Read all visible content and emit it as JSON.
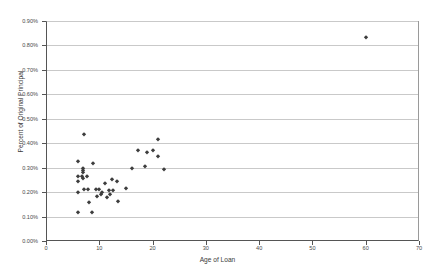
{
  "chart_data": {
    "type": "scatter",
    "title": "",
    "xlabel": "Age of Loan",
    "ylabel": "Percent of Original Principal",
    "xlim": [
      0,
      70
    ],
    "ylim": [
      0.0,
      0.9
    ],
    "xticks": [
      0,
      10,
      20,
      30,
      40,
      50,
      60,
      70
    ],
    "xtick_labels": [
      "0",
      "10",
      "20",
      "30",
      "40",
      "50",
      "60",
      "70"
    ],
    "yticks": [
      0.0,
      0.1,
      0.2,
      0.3,
      0.4,
      0.5,
      0.6,
      0.7,
      0.8,
      0.9
    ],
    "ytick_labels": [
      "0.00%",
      "0.10%",
      "0.20%",
      "0.30%",
      "0.40%",
      "0.50%",
      "0.60%",
      "0.70%",
      "0.80%",
      "0.90%"
    ],
    "grid": "horizontal",
    "legend": "none",
    "marker": "diamond",
    "marker_color": "#3d3d3d",
    "series": [
      {
        "name": "Loans",
        "points": [
          [
            5.8,
            0.205
          ],
          [
            5.8,
            0.248
          ],
          [
            5.8,
            0.272
          ],
          [
            5.8,
            0.332
          ],
          [
            5.8,
            0.122
          ],
          [
            6.6,
            0.272
          ],
          [
            6.7,
            0.287
          ],
          [
            6.8,
            0.296
          ],
          [
            6.8,
            0.302
          ],
          [
            6.8,
            0.262
          ],
          [
            6.9,
            0.215
          ],
          [
            7.0,
            0.443
          ],
          [
            7.6,
            0.272
          ],
          [
            7.7,
            0.216
          ],
          [
            7.8,
            0.165
          ],
          [
            8.4,
            0.122
          ],
          [
            8.6,
            0.322
          ],
          [
            9.2,
            0.218
          ],
          [
            9.4,
            0.188
          ],
          [
            9.8,
            0.218
          ],
          [
            10.2,
            0.196
          ],
          [
            10.4,
            0.205
          ],
          [
            10.9,
            0.24
          ],
          [
            11.2,
            0.186
          ],
          [
            11.6,
            0.212
          ],
          [
            11.9,
            0.198
          ],
          [
            12.2,
            0.257
          ],
          [
            12.4,
            0.212
          ],
          [
            13.1,
            0.251
          ],
          [
            13.4,
            0.168
          ],
          [
            14.9,
            0.222
          ],
          [
            16.0,
            0.301
          ],
          [
            17.0,
            0.377
          ],
          [
            18.4,
            0.312
          ],
          [
            18.8,
            0.369
          ],
          [
            19.9,
            0.375
          ],
          [
            20.8,
            0.42
          ],
          [
            20.9,
            0.35
          ],
          [
            21.9,
            0.3
          ],
          [
            59.8,
            0.838
          ]
        ]
      }
    ]
  }
}
